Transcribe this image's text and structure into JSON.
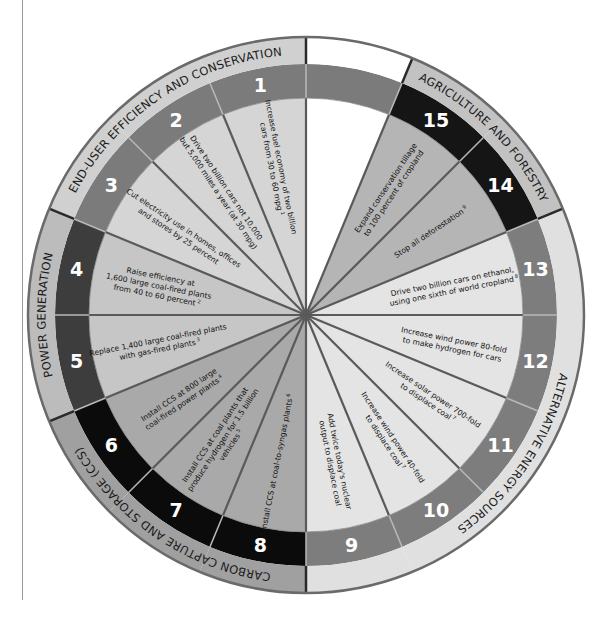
{
  "diagram": {
    "type": "stabilization-wedge-wheel",
    "slot_count": 16,
    "empty_slot_index": 0,
    "categories": [
      {
        "id": "end-user",
        "label": "END-USER EFFICIENCY AND CONSERVATION",
        "wedges": [
          1,
          2,
          3
        ],
        "colors": {
          "inner": "#d5d5d5",
          "band": "#7b7b7b",
          "label": "#d0d0d0"
        }
      },
      {
        "id": "power",
        "label": "POWER GENERATION",
        "wedges": [
          4,
          5
        ],
        "colors": {
          "inner": "#c6c6c6",
          "band": "#3d3d3d",
          "label": "#bcbcbc"
        }
      },
      {
        "id": "ccs",
        "label": "CARBON CAPTURE AND STORAGE (CCS)",
        "wedges": [
          6,
          7,
          8
        ],
        "colors": {
          "inner": "#a9a9a9",
          "band": "#0b0b0b",
          "label": "#a0a0a0"
        }
      },
      {
        "id": "alternative",
        "label": "ALTERNATIVE ENERGY SOURCES",
        "wedges": [
          9,
          10,
          11,
          12,
          13
        ],
        "colors": {
          "inner": "#e4e4e4",
          "band": "#7d7d7d",
          "label": "#e0e0e0"
        }
      },
      {
        "id": "agriculture",
        "label": "AGRICULTURE AND FORESTRY",
        "wedges": [
          14,
          15
        ],
        "colors": {
          "inner": "#b5b5b5",
          "band": "#151515",
          "label": "#c2c2c2"
        }
      }
    ],
    "empty_slot_colors": {
      "inner": "#ffffff",
      "band": "#7b7b7b",
      "label": "#ffffff"
    },
    "wedges": [
      {
        "number": "1",
        "category": "end-user",
        "lines": [
          "Increase fuel economy of two billion",
          "cars from 30 to 60 mpg"
        ],
        "note": "1"
      },
      {
        "number": "2",
        "category": "end-user",
        "lines": [
          "Drive two billion cars not 10,000",
          "but 5,000 miles a year (at 30 mpg)"
        ],
        "note": ""
      },
      {
        "number": "3",
        "category": "end-user",
        "lines": [
          "Cut electricity use in homes, offices",
          "and stores by 25 percent"
        ],
        "note": ""
      },
      {
        "number": "4",
        "category": "power",
        "lines": [
          "Raise efficiency at",
          "1,600 large coal-fired plants",
          "from 40 to 60 percent"
        ],
        "note": "2"
      },
      {
        "number": "5",
        "category": "power",
        "lines": [
          "Replace 1,400 large coal-fired plants",
          "with gas-fired plants"
        ],
        "note": "3"
      },
      {
        "number": "6",
        "category": "ccs",
        "lines": [
          "Install CCS at 800 large",
          "coal-fired power plants"
        ],
        "note": "4"
      },
      {
        "number": "7",
        "category": "ccs",
        "lines": [
          "Install CCS at coal plants that",
          "produce hydrogen for 1.5 billion",
          "vehicles"
        ],
        "note": "5"
      },
      {
        "number": "8",
        "category": "ccs",
        "lines": [
          "Install CCS at coal-to-syngas plants"
        ],
        "note": "6"
      },
      {
        "number": "9",
        "category": "alternative",
        "lines": [
          "Add twice today's nuclear",
          "output to displace coal"
        ],
        "note": ""
      },
      {
        "number": "10",
        "category": "alternative",
        "lines": [
          "Increase wind power 40-fold",
          "to displace coal"
        ],
        "note": "7"
      },
      {
        "number": "11",
        "category": "alternative",
        "lines": [
          "Increase solar power 700-fold",
          "to displace coal"
        ],
        "note": "7"
      },
      {
        "number": "12",
        "category": "alternative",
        "lines": [
          "Increase wind power 80-fold",
          "to make hydrogen for cars"
        ],
        "note": ""
      },
      {
        "number": "13",
        "category": "alternative",
        "lines": [
          "Drive two billion cars on ethanol,",
          "using one sixth of world cropland"
        ],
        "note": "8"
      },
      {
        "number": "14",
        "category": "agriculture",
        "lines": [
          "Stop all deforestation"
        ],
        "note": "9"
      },
      {
        "number": "15",
        "category": "agriculture",
        "lines": [
          "Expand conservation tillage",
          "to 100 percent of cropland"
        ],
        "note": ""
      }
    ]
  },
  "geometry": {
    "cx": 306,
    "cy": 315,
    "r_outer": 278,
    "r_label_inner": 251,
    "r_band_inner": 217
  }
}
